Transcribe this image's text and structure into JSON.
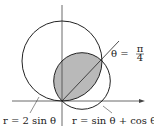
{
  "diagram": {
    "type": "polar-region",
    "curves": [
      {
        "id": "big-circle",
        "equation": "r = 2 sin θ",
        "label": "r = 2 sin θ"
      },
      {
        "id": "small-circle",
        "equation": "r = sin θ + cos θ",
        "label": "r = sin θ + cos θ"
      }
    ],
    "ray": {
      "label_lhs": "θ =",
      "label_num": "π",
      "label_den": "4"
    },
    "shaded_region": "intersection of the two circles",
    "colors": {
      "stroke": "#222222",
      "fill": "#b9b9b9"
    }
  },
  "labels": {
    "big": "r = 2 sin θ",
    "small": "r = sin θ + cos θ",
    "theta_lhs": "θ =",
    "theta_num": "π",
    "theta_den": "4"
  }
}
